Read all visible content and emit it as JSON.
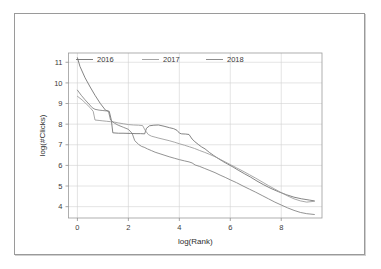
{
  "chart_data": {
    "type": "line",
    "title": "",
    "xlabel": "log(Rank)",
    "ylabel": "log(#Clicks)",
    "xlim": [
      -0.35,
      9.6
    ],
    "ylim": [
      3.45,
      11.45
    ],
    "xticks": [
      0,
      2,
      4,
      6,
      8
    ],
    "yticks": [
      4,
      5,
      6,
      7,
      8,
      9,
      10,
      11
    ],
    "grid": true,
    "legend_position": "top-inside",
    "legend": [
      "2016",
      "2017",
      "2018"
    ],
    "colors": {
      "2016": "#6e6e6e",
      "2017": "#9a9a9a",
      "2018": "#808080",
      "grid": "#d2d2d2",
      "axis": "#9b9b9b",
      "text": "#3a3a3a",
      "frame": "#9a9a9a",
      "background": "#ffffff"
    },
    "series": [
      {
        "name": "2016",
        "color": "#6e6e6e",
        "points": [
          [
            0.0,
            11.22
          ],
          [
            0.1,
            10.8
          ],
          [
            0.3,
            10.25
          ],
          [
            0.5,
            9.8
          ],
          [
            0.69,
            9.4
          ],
          [
            0.9,
            9.0
          ],
          [
            1.1,
            8.68
          ],
          [
            1.25,
            8.62
          ],
          [
            1.33,
            8.2
          ],
          [
            1.39,
            7.58
          ],
          [
            1.61,
            7.56
          ],
          [
            1.79,
            7.56
          ],
          [
            2.08,
            7.55
          ],
          [
            2.3,
            7.54
          ],
          [
            2.48,
            7.54
          ],
          [
            2.64,
            7.53
          ],
          [
            2.71,
            7.8
          ],
          [
            2.83,
            7.92
          ],
          [
            3.0,
            7.95
          ],
          [
            3.18,
            7.96
          ],
          [
            3.4,
            7.9
          ],
          [
            3.61,
            7.83
          ],
          [
            3.78,
            7.78
          ],
          [
            3.91,
            7.7
          ],
          [
            4.01,
            7.56
          ],
          [
            4.09,
            7.53
          ],
          [
            4.25,
            7.52
          ],
          [
            4.38,
            7.5
          ],
          [
            4.5,
            7.28
          ],
          [
            4.61,
            7.15
          ],
          [
            4.74,
            7.02
          ],
          [
            4.87,
            6.9
          ],
          [
            5.01,
            6.8
          ],
          [
            5.19,
            6.62
          ],
          [
            5.35,
            6.48
          ],
          [
            5.52,
            6.34
          ],
          [
            5.7,
            6.2
          ],
          [
            5.89,
            6.07
          ],
          [
            6.11,
            5.92
          ],
          [
            6.31,
            5.77
          ],
          [
            6.55,
            5.6
          ],
          [
            6.8,
            5.43
          ],
          [
            7.05,
            5.24
          ],
          [
            7.31,
            5.06
          ],
          [
            7.6,
            4.88
          ],
          [
            7.9,
            4.72
          ],
          [
            8.2,
            4.58
          ],
          [
            8.5,
            4.46
          ],
          [
            8.8,
            4.38
          ],
          [
            9.1,
            4.32
          ],
          [
            9.3,
            4.28
          ]
        ]
      },
      {
        "name": "2017",
        "color": "#9a9a9a",
        "points": [
          [
            0.0,
            9.35
          ],
          [
            0.18,
            9.18
          ],
          [
            0.35,
            8.98
          ],
          [
            0.5,
            8.8
          ],
          [
            0.62,
            8.62
          ],
          [
            0.69,
            8.2
          ],
          [
            0.85,
            8.18
          ],
          [
            1.0,
            8.16
          ],
          [
            1.15,
            8.14
          ],
          [
            1.3,
            8.12
          ],
          [
            1.45,
            8.1
          ],
          [
            1.6,
            8.06
          ],
          [
            1.8,
            8.02
          ],
          [
            2.0,
            7.98
          ],
          [
            2.2,
            7.96
          ],
          [
            2.4,
            7.95
          ],
          [
            2.56,
            7.93
          ],
          [
            2.66,
            7.7
          ],
          [
            2.78,
            7.5
          ],
          [
            2.9,
            7.42
          ],
          [
            3.05,
            7.37
          ],
          [
            3.2,
            7.32
          ],
          [
            3.4,
            7.26
          ],
          [
            3.6,
            7.2
          ],
          [
            3.8,
            7.13
          ],
          [
            4.0,
            7.05
          ],
          [
            4.2,
            6.98
          ],
          [
            4.4,
            6.9
          ],
          [
            4.6,
            6.82
          ],
          [
            4.8,
            6.72
          ],
          [
            5.0,
            6.63
          ],
          [
            5.2,
            6.53
          ],
          [
            5.4,
            6.42
          ],
          [
            5.6,
            6.3
          ],
          [
            5.8,
            6.17
          ],
          [
            6.0,
            6.04
          ],
          [
            6.25,
            5.88
          ],
          [
            6.5,
            5.72
          ],
          [
            6.75,
            5.55
          ],
          [
            7.0,
            5.38
          ],
          [
            7.25,
            5.2
          ],
          [
            7.5,
            5.02
          ],
          [
            7.75,
            4.85
          ],
          [
            8.0,
            4.68
          ],
          [
            8.25,
            4.52
          ],
          [
            8.5,
            4.38
          ],
          [
            8.75,
            4.28
          ],
          [
            9.0,
            4.22
          ],
          [
            9.3,
            4.26
          ]
        ]
      },
      {
        "name": "2018",
        "color": "#808080",
        "points": [
          [
            0.0,
            9.65
          ],
          [
            0.15,
            9.4
          ],
          [
            0.3,
            9.18
          ],
          [
            0.45,
            8.98
          ],
          [
            0.58,
            8.8
          ],
          [
            0.69,
            8.72
          ],
          [
            0.85,
            8.68
          ],
          [
            1.0,
            8.66
          ],
          [
            1.15,
            8.64
          ],
          [
            1.22,
            8.62
          ],
          [
            1.3,
            8.2
          ],
          [
            1.45,
            8.05
          ],
          [
            1.6,
            7.95
          ],
          [
            1.8,
            7.85
          ],
          [
            2.0,
            7.75
          ],
          [
            2.15,
            7.55
          ],
          [
            2.25,
            7.2
          ],
          [
            2.4,
            7.02
          ],
          [
            2.52,
            6.92
          ],
          [
            2.62,
            6.88
          ],
          [
            2.75,
            6.8
          ],
          [
            2.9,
            6.72
          ],
          [
            3.05,
            6.64
          ],
          [
            3.2,
            6.58
          ],
          [
            3.4,
            6.5
          ],
          [
            3.6,
            6.42
          ],
          [
            3.8,
            6.35
          ],
          [
            4.0,
            6.28
          ],
          [
            4.2,
            6.22
          ],
          [
            4.38,
            6.17
          ],
          [
            4.5,
            6.12
          ],
          [
            4.62,
            6.02
          ],
          [
            4.8,
            5.95
          ],
          [
            5.0,
            5.85
          ],
          [
            5.2,
            5.75
          ],
          [
            5.4,
            5.65
          ],
          [
            5.6,
            5.53
          ],
          [
            5.8,
            5.42
          ],
          [
            6.0,
            5.3
          ],
          [
            6.25,
            5.16
          ],
          [
            6.5,
            5.0
          ],
          [
            6.75,
            4.85
          ],
          [
            7.0,
            4.7
          ],
          [
            7.25,
            4.54
          ],
          [
            7.5,
            4.38
          ],
          [
            7.75,
            4.22
          ],
          [
            8.0,
            4.08
          ],
          [
            8.25,
            3.94
          ],
          [
            8.5,
            3.82
          ],
          [
            8.75,
            3.72
          ],
          [
            9.0,
            3.66
          ],
          [
            9.3,
            3.62
          ]
        ]
      }
    ]
  }
}
